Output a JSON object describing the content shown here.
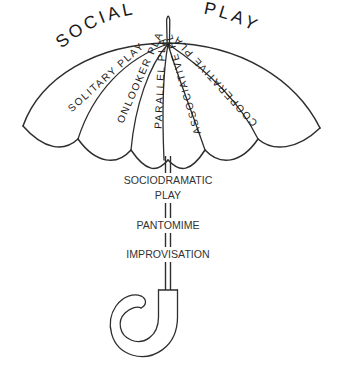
{
  "diagram": {
    "title": "SOCIAL PLAY",
    "title_words": [
      "SOCIAL",
      "PLAY"
    ],
    "type": "umbrella-concept-diagram",
    "background_color": "#ffffff",
    "line_color": "#2e2e2e",
    "text_color": "#1d1d1d",
    "canopy": {
      "panel_count": 6,
      "labels": [
        "SOLITARY PLAY",
        "ONLOOKER PLAY",
        "PARALLEL PLAY",
        "ASSOCIATIVE PLAY",
        "COOPERATIVE PLAY"
      ]
    },
    "shaft": {
      "labels": [
        "SOCIODRAMATIC",
        "PLAY",
        "PANTOMIME",
        "IMPROVISATION"
      ],
      "stem_items": [
        {
          "line1": "SOCIODRAMATIC",
          "line2": "PLAY"
        },
        {
          "line1": "PANTOMIME",
          "line2": ""
        },
        {
          "line1": "IMPROVISATION",
          "line2": ""
        }
      ]
    },
    "handle": {
      "shape": "j-hook",
      "direction": "left"
    },
    "finial": {
      "shape": "tapered-spike"
    }
  }
}
